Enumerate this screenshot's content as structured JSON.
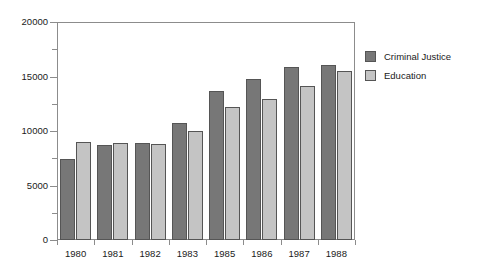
{
  "chart_data": {
    "type": "bar",
    "title": "",
    "xlabel": "",
    "ylabel": "",
    "categories": [
      "1980",
      "1981",
      "1982",
      "1983",
      "1985",
      "1986",
      "1987",
      "1988"
    ],
    "series": [
      {
        "name": "Criminal Justice",
        "color": "#777777",
        "values": [
          7400,
          8700,
          8900,
          10700,
          13700,
          14800,
          15900,
          16100
        ]
      },
      {
        "name": "Education",
        "color": "#c4c4c4",
        "values": [
          9000,
          8900,
          8800,
          10000,
          12200,
          12900,
          14100,
          15500
        ]
      }
    ],
    "ylim": [
      0,
      20000
    ],
    "y_major_ticks": [
      0,
      5000,
      10000,
      15000,
      20000
    ],
    "y_major_tick_labels": [
      "0",
      "5000",
      "10000",
      "15000",
      "20000"
    ],
    "y_minor_ticks": [
      2500,
      7500,
      12500,
      17500
    ],
    "grid": false,
    "legend_position": "right"
  },
  "legend": {
    "entries": [
      {
        "label": "Criminal Justice"
      },
      {
        "label": "Education"
      }
    ]
  }
}
